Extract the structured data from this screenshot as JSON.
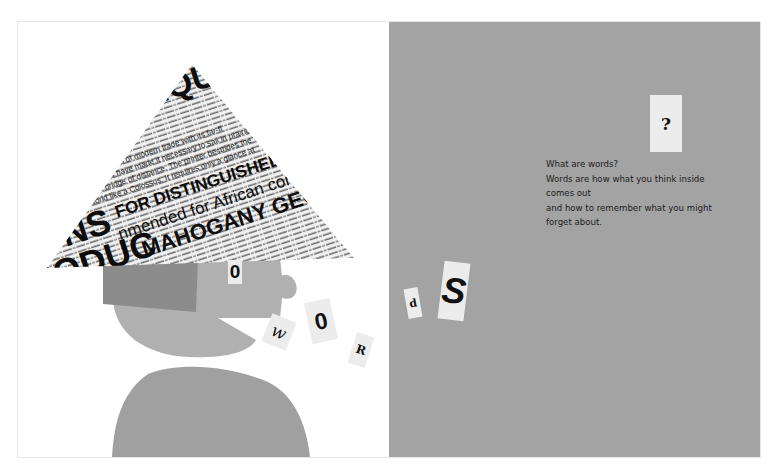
{
  "book": {
    "left_page": {
      "hat_headlines": [
        "EQUE",
        "IONS",
        "RODUC",
        "FOR DISTINGUISHED COMMA",
        "nmended for African conquer",
        "MAHOGANY GEORG"
      ],
      "hat_body_text": [
        "e demands of modern trade with its far-fl",
        "markets have made it necessary to sail in prairie",
        "as a bridge of distance. The printer bestrides the",
        "world like a Colossus. It requires only a glance at"
      ],
      "letter_cards": [
        {
          "char": "0",
          "style": "sans"
        },
        {
          "char": "w",
          "style": "script"
        },
        {
          "char": "0",
          "style": "sans"
        },
        {
          "char": "R",
          "style": "serif"
        }
      ]
    },
    "right_page": {
      "letter_cards": [
        {
          "char": "d",
          "style": "serif"
        },
        {
          "char": "S",
          "style": "sans"
        },
        {
          "char": "?",
          "style": "serif"
        }
      ],
      "story_lines": [
        "What are words?",
        "Words are how what you think inside",
        "comes out",
        "and how to remember what you might",
        "forget about."
      ]
    },
    "colors": {
      "right_page_bg": "#a3a3a3",
      "head_light": "#b0b0b0",
      "head_dark": "#8c8c8c",
      "body": "#a0a0a0",
      "card": "#ececec"
    }
  }
}
